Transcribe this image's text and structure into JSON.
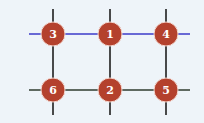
{
  "diagram": {
    "background": "#eef4f9",
    "colors": {
      "top_line": "#3b3bc8",
      "bottom_line": "#2e3b2e",
      "vertical_line": "#1e1e1e",
      "node_fill": "#b4412d",
      "node_stroke": "#f3d7cf",
      "label": "#ffffff"
    },
    "nodes": [
      {
        "id": "3",
        "label": "3",
        "row": 0,
        "col": 0
      },
      {
        "id": "1",
        "label": "1",
        "row": 0,
        "col": 1
      },
      {
        "id": "4",
        "label": "4",
        "row": 0,
        "col": 2
      },
      {
        "id": "6",
        "label": "6",
        "row": 1,
        "col": 0
      },
      {
        "id": "2",
        "label": "2",
        "row": 1,
        "col": 1
      },
      {
        "id": "5",
        "label": "5",
        "row": 1,
        "col": 2
      }
    ],
    "edges": [
      {
        "from": "3",
        "to": "1",
        "style": "top"
      },
      {
        "from": "1",
        "to": "4",
        "style": "top"
      },
      {
        "from": "6",
        "to": "2",
        "style": "bottom"
      },
      {
        "from": "2",
        "to": "5",
        "style": "bottom"
      },
      {
        "from": "3",
        "to": "6",
        "style": "vertical"
      },
      {
        "from": "1",
        "to": "2",
        "style": "vertical"
      },
      {
        "from": "4",
        "to": "5",
        "style": "vertical"
      }
    ]
  }
}
